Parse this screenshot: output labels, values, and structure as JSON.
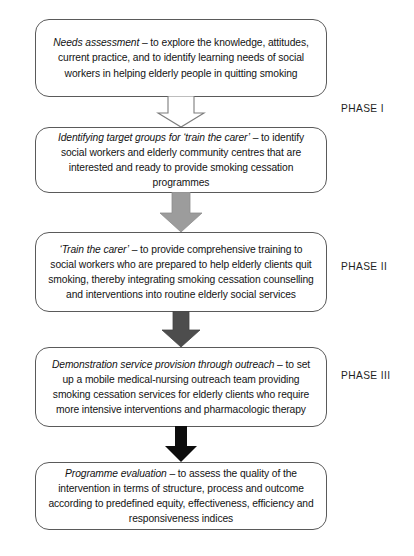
{
  "diagram": {
    "colors": {
      "box_border": "#5a5a5a",
      "box_fill": "#ffffff",
      "text": "#131313",
      "arrow_1_fill": "#ffffff",
      "arrow_1_stroke": "#7a7a7a",
      "arrow_2_fill": "#9a9a9a",
      "arrow_3_fill": "#4a4a4a",
      "arrow_4_fill": "#0d0d0d"
    },
    "nodes": [
      {
        "id": "needs-assessment",
        "lead": "Needs assessment",
        "body": " – to explore the knowledge, attitudes, current practice, and to identify learning needs of social workers in helping elderly people in quitting smoking"
      },
      {
        "id": "identifying-target-groups",
        "lead": "Identifying target groups for ‘train the carer’",
        "body": " – to identify social workers and elderly community centres that are interested and ready to provide smoking cessation programmes"
      },
      {
        "id": "train-the-carer",
        "lead": "‘Train the carer’",
        "body": " – to provide comprehensive training to social workers who are prepared to help elderly clients quit smoking, thereby integrating smoking cessation counselling and interventions into routine elderly social services"
      },
      {
        "id": "demonstration-service-provision",
        "lead": "Demonstration service provision through outreach",
        "body": " – to set up a mobile medical-nursing outreach team providing smoking cessation services for elderly clients who require more intensive interventions and pharmacologic therapy"
      },
      {
        "id": "programme-evaluation",
        "lead": "Programme evaluation",
        "body": " – to assess the quality of the intervention in terms of structure, process and outcome according to predefined equity, effectiveness, efficiency and responsiveness indices"
      }
    ],
    "arrows": [
      {
        "id": "arrow-1",
        "style": "hollow-outline"
      },
      {
        "id": "arrow-2",
        "style": "gray-filled"
      },
      {
        "id": "arrow-3",
        "style": "dark-gray-filled"
      },
      {
        "id": "arrow-4",
        "style": "black-filled"
      }
    ],
    "phases": [
      {
        "id": "phase-1",
        "label": "PHASE I"
      },
      {
        "id": "phase-2",
        "label": "PHASE II"
      },
      {
        "id": "phase-3",
        "label": "PHASE III"
      }
    ]
  }
}
